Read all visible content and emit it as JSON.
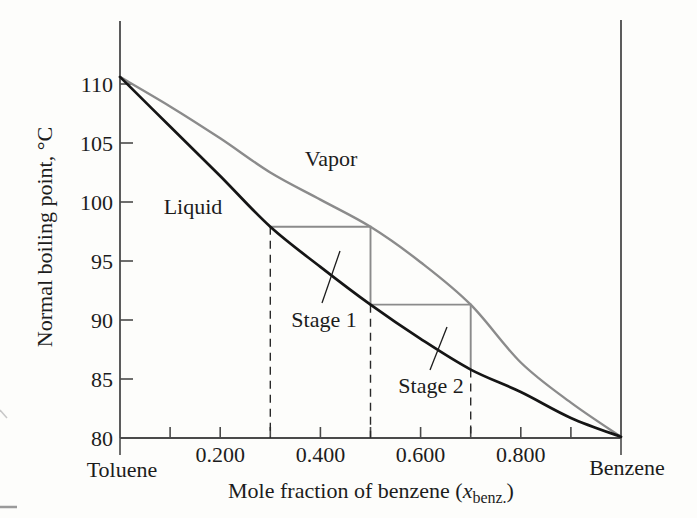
{
  "figure_type": "temperature-composition phase diagram",
  "colors": {
    "background": "#fdfdfb",
    "liquid_curve": "#151515",
    "vapor_curve": "#8b8b8b",
    "step_lines": "#8b8b8b",
    "axis": "#4a4a4a",
    "dashed_guides": "#2a2a2a",
    "text": "#1c1c1c"
  },
  "y_axis": {
    "label": "Normal boiling point, °C",
    "tick_values": [
      110,
      105,
      100,
      95,
      90,
      85,
      80
    ],
    "tick_labels": [
      "110",
      "105",
      "100",
      "95",
      "90",
      "85",
      "80"
    ]
  },
  "x_axis": {
    "label_main": "Mole fraction of benzene (",
    "label_italic": "x",
    "label_sub": "benz.",
    "label_end": ")",
    "major_ticks": [
      {
        "value": 0.2,
        "label": "0.200"
      },
      {
        "value": 0.4,
        "label": "0.400"
      },
      {
        "value": 0.6,
        "label": "0.600"
      },
      {
        "value": 0.8,
        "label": "0.800"
      }
    ],
    "minor_tick_values": [
      0.1,
      0.2,
      0.3,
      0.4,
      0.5,
      0.6,
      0.7,
      0.8,
      0.9
    ],
    "left_endpoint": "Toluene",
    "right_endpoint": "Benzene"
  },
  "curve_labels": {
    "vapor": "Vapor",
    "liquid": "Liquid"
  },
  "chart_data": {
    "type": "line",
    "title": "",
    "xlabel": "Mole fraction of benzene (x_benz.)",
    "ylabel": "Normal boiling point, °C",
    "xlim": [
      0,
      1
    ],
    "ylim": [
      80,
      110
    ],
    "grid": false,
    "x": [
      0,
      0.1,
      0.2,
      0.3,
      0.4,
      0.5,
      0.6,
      0.7,
      0.8,
      0.9,
      1.0
    ],
    "series": [
      {
        "name": "Liquid",
        "values": [
          110.6,
          106.4,
          102.2,
          97.9,
          94.5,
          91.3,
          88.4,
          85.8,
          83.9,
          81.7,
          80.1
        ]
      },
      {
        "name": "Vapor",
        "values": [
          110.6,
          108.1,
          105.4,
          102.5,
          100.2,
          97.9,
          94.9,
          91.3,
          86.4,
          83.0,
          80.1
        ]
      }
    ],
    "endpoints": {
      "toluene_boiling_point_C": 110.6,
      "benzene_boiling_point_C": 80.1
    },
    "stages": [
      {
        "label": "Stage 1",
        "liquid_x": 0.3,
        "vapor_x": 0.5,
        "tie_T": 97.9,
        "drop_to_T": 91.3
      },
      {
        "label": "Stage 2",
        "liquid_x": 0.5,
        "vapor_x": 0.7,
        "tie_T": 91.3,
        "drop_to_T": 85.8
      }
    ],
    "dashed_guides": [
      {
        "x": 0.3,
        "top_T": 97.9
      },
      {
        "x": 0.5,
        "top_T": 91.3
      },
      {
        "x": 0.7,
        "top_T": 85.8
      }
    ]
  }
}
